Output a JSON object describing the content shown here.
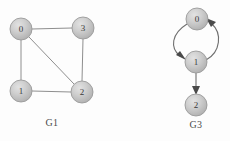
{
  "figure": {
    "background_color": "#fdfdfd",
    "node_fill_center": "#d6d6d6",
    "node_fill_edge": "#b4b4b4",
    "node_stroke_color": "#9a9a9a",
    "edge_color": "#8e8e8e",
    "arrow_color": "#4a4a4a",
    "label_color": "#3a3a3a",
    "node_radius": 11
  },
  "graphs": [
    {
      "id": "G1",
      "caption": "G1",
      "caption_x": 52,
      "caption_y": 117,
      "directed": false,
      "nodes": [
        {
          "label": "0",
          "x": 21,
          "y": 29
        },
        {
          "label": "3",
          "x": 83,
          "y": 28
        },
        {
          "label": "1",
          "x": 21,
          "y": 91
        },
        {
          "label": "2",
          "x": 82,
          "y": 92
        }
      ],
      "edges": [
        {
          "from": "0",
          "to": "3"
        },
        {
          "from": "0",
          "to": "1"
        },
        {
          "from": "0",
          "to": "2"
        },
        {
          "from": "1",
          "to": "2"
        },
        {
          "from": "3",
          "to": "2"
        }
      ]
    },
    {
      "id": "G3",
      "caption": "G3",
      "caption_x": 196,
      "caption_y": 119,
      "directed": true,
      "nodes": [
        {
          "label": "0",
          "x": 197,
          "y": 19
        },
        {
          "label": "1",
          "x": 196,
          "y": 62
        },
        {
          "label": "2",
          "x": 196,
          "y": 105
        }
      ],
      "edges": [
        {
          "from": "0",
          "to": "1",
          "style": "curve-left"
        },
        {
          "from": "1",
          "to": "0",
          "style": "curve-right"
        },
        {
          "from": "1",
          "to": "2",
          "style": "straight"
        }
      ]
    }
  ]
}
